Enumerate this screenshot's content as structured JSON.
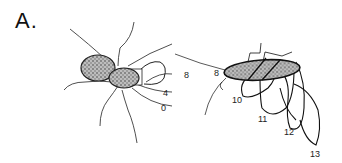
{
  "panel": {
    "label": "A."
  },
  "left_cell": {
    "description": "dividing bacterial cell with peritrichous flagella and flagellar bundle",
    "labels": [
      "8",
      "4",
      "0"
    ]
  },
  "right_cell": {
    "description": "elongated bacterial cell with coiled flagellar filaments",
    "labels": [
      "8",
      "10",
      "11",
      "12",
      "13"
    ]
  },
  "colors": {
    "ink": "#1a1a1a",
    "stipple": "#888888",
    "background": "#ffffff"
  }
}
